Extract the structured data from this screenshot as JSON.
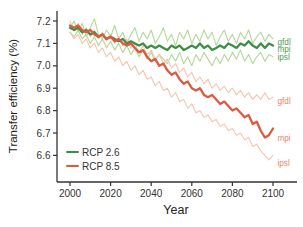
{
  "chart_data": {
    "type": "line",
    "title": "",
    "xlabel": "Year",
    "ylabel": "Transfer efficiency (%)",
    "x_ticks": [
      2000,
      2020,
      2040,
      2060,
      2080,
      2100
    ],
    "y_ticks": [
      7.2,
      7.1,
      7.0,
      6.9,
      6.8,
      6.7,
      6.6
    ],
    "xlim": [
      2000,
      2100
    ],
    "ylim": [
      6.55,
      7.22
    ],
    "grid": false,
    "axis_color": "#333333",
    "tick_label_color": "#333333",
    "x": [
      2000,
      2002,
      2004,
      2006,
      2008,
      2010,
      2012,
      2014,
      2016,
      2018,
      2020,
      2022,
      2024,
      2026,
      2028,
      2030,
      2032,
      2034,
      2036,
      2038,
      2040,
      2042,
      2044,
      2046,
      2048,
      2050,
      2052,
      2054,
      2056,
      2058,
      2060,
      2062,
      2064,
      2066,
      2068,
      2070,
      2072,
      2074,
      2076,
      2078,
      2080,
      2082,
      2084,
      2086,
      2088,
      2090,
      2092,
      2094,
      2096,
      2098,
      2100
    ],
    "series": [
      {
        "name": "gfdl",
        "scenario": "RCP 2.6",
        "color": "#b3d89c",
        "width": 1.1,
        "values": [
          7.17,
          7.2,
          7.15,
          7.19,
          7.13,
          7.17,
          7.21,
          7.14,
          7.12,
          7.16,
          7.13,
          7.18,
          7.12,
          7.15,
          7.1,
          7.14,
          7.17,
          7.11,
          7.15,
          7.12,
          7.16,
          7.1,
          7.13,
          7.17,
          7.11,
          7.14,
          7.09,
          7.15,
          7.12,
          7.16,
          7.1,
          7.14,
          7.11,
          7.16,
          7.12,
          7.15,
          7.09,
          7.13,
          7.16,
          7.11,
          7.14,
          7.1,
          7.15,
          7.12,
          7.16,
          7.1,
          7.13,
          7.15,
          7.11,
          7.14,
          7.12
        ]
      },
      {
        "name": "ipsl",
        "scenario": "RCP 2.6",
        "color": "#b3d89c",
        "width": 1.1,
        "values": [
          7.15,
          7.13,
          7.16,
          7.12,
          7.14,
          7.1,
          7.13,
          7.09,
          7.12,
          7.08,
          7.11,
          7.07,
          7.1,
          7.06,
          7.09,
          7.05,
          7.08,
          7.04,
          7.07,
          7.03,
          7.06,
          7.02,
          7.05,
          7.03,
          7.01,
          7.05,
          7.02,
          7.06,
          7.01,
          7.04,
          7.0,
          7.05,
          7.02,
          7.06,
          7.03,
          7.0,
          7.04,
          7.01,
          7.05,
          7.02,
          7.06,
          7.03,
          7.07,
          7.02,
          7.05,
          7.01,
          7.04,
          7.06,
          7.02,
          7.05,
          7.04
        ]
      },
      {
        "name": "gfdl",
        "scenario": "RCP 8.5",
        "color": "#f4c5b1",
        "width": 1.1,
        "values": [
          7.2,
          7.16,
          7.19,
          7.14,
          7.17,
          7.13,
          7.16,
          7.12,
          7.15,
          7.11,
          7.14,
          7.1,
          7.13,
          7.09,
          7.12,
          7.08,
          7.1,
          7.06,
          7.09,
          7.05,
          7.07,
          7.03,
          7.05,
          7.01,
          7.03,
          6.99,
          7.01,
          6.97,
          6.99,
          6.95,
          6.97,
          6.93,
          6.95,
          6.92,
          6.94,
          6.9,
          6.92,
          6.89,
          6.91,
          6.88,
          6.9,
          6.87,
          6.89,
          6.86,
          6.88,
          6.85,
          6.87,
          6.85,
          6.88,
          6.85,
          6.86
        ]
      },
      {
        "name": "ipsl",
        "scenario": "RCP 8.5",
        "color": "#f4c5b1",
        "width": 1.1,
        "values": [
          7.15,
          7.12,
          7.14,
          7.1,
          7.12,
          7.08,
          7.1,
          7.06,
          7.08,
          7.04,
          7.06,
          7.02,
          7.04,
          7.0,
          7.02,
          6.98,
          7.0,
          6.96,
          6.98,
          6.94,
          6.95,
          6.91,
          6.93,
          6.89,
          6.9,
          6.86,
          6.88,
          6.84,
          6.85,
          6.81,
          6.83,
          6.79,
          6.8,
          6.77,
          6.78,
          6.75,
          6.76,
          6.73,
          6.74,
          6.71,
          6.72,
          6.69,
          6.7,
          6.67,
          6.68,
          6.64,
          6.65,
          6.62,
          6.6,
          6.58,
          6.6
        ]
      },
      {
        "name": "mpi",
        "scenario": "RCP 2.6",
        "color": "#3e8e44",
        "width": 2.3,
        "values": [
          7.17,
          7.16,
          7.17,
          7.15,
          7.16,
          7.14,
          7.15,
          7.13,
          7.14,
          7.12,
          7.13,
          7.12,
          7.11,
          7.12,
          7.1,
          7.11,
          7.1,
          7.09,
          7.1,
          7.08,
          7.09,
          7.08,
          7.09,
          7.08,
          7.07,
          7.09,
          7.08,
          7.09,
          7.07,
          7.08,
          7.09,
          7.08,
          7.1,
          7.08,
          7.09,
          7.07,
          7.08,
          7.09,
          7.08,
          7.1,
          7.09,
          7.08,
          7.1,
          7.09,
          7.11,
          7.09,
          7.08,
          7.1,
          7.08,
          7.1,
          7.09
        ]
      },
      {
        "name": "mpi",
        "scenario": "RCP 8.5",
        "color": "#dd5a41",
        "width": 2.3,
        "values": [
          7.18,
          7.17,
          7.18,
          7.16,
          7.15,
          7.16,
          7.14,
          7.13,
          7.14,
          7.12,
          7.13,
          7.11,
          7.12,
          7.1,
          7.09,
          7.1,
          7.08,
          7.06,
          7.07,
          7.04,
          7.02,
          7.03,
          7.0,
          7.01,
          6.98,
          6.96,
          6.97,
          6.94,
          6.92,
          6.93,
          6.9,
          6.89,
          6.9,
          6.87,
          6.86,
          6.87,
          6.85,
          6.83,
          6.84,
          6.82,
          6.8,
          6.81,
          6.79,
          6.77,
          6.78,
          6.74,
          6.75,
          6.71,
          6.68,
          6.69,
          6.72
        ]
      }
    ],
    "annotations": [
      {
        "text": "gfdl",
        "scenario": "RCP 2.6",
        "at_value": 7.105,
        "color": "#4f9b52"
      },
      {
        "text": "mpi",
        "scenario": "RCP 2.6",
        "at_value": 7.075,
        "color": "#4f9b52"
      },
      {
        "text": "ipsl",
        "scenario": "RCP 2.6",
        "at_value": 7.04,
        "color": "#4f9b52"
      },
      {
        "text": "gfdl",
        "scenario": "RCP 8.5",
        "at_value": 6.84,
        "color": "#ec8168"
      },
      {
        "text": "mpi",
        "scenario": "RCP 8.5",
        "at_value": 6.675,
        "color": "#ec8168"
      },
      {
        "text": "ipsl",
        "scenario": "RCP 8.5",
        "at_value": 6.565,
        "color": "#ec8168"
      }
    ],
    "legend": {
      "position": "bottom-left",
      "items": [
        {
          "label": "RCP 2.6",
          "color": "#3e8e44"
        },
        {
          "label": "RCP 8.5",
          "color": "#dd5a41"
        }
      ]
    }
  }
}
